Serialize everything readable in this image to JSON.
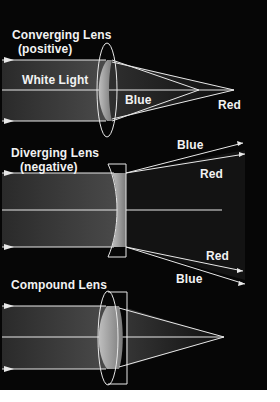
{
  "diagram": {
    "colors": {
      "background": "#060606",
      "line": "#e8e8e8",
      "text": "#f2f2f2",
      "page": "#ffffff"
    },
    "panels": [
      {
        "id": "converging",
        "title": "Converging Lens",
        "subtitle": "(positive)",
        "beam_label": "White Light",
        "labels": {
          "blue": "Blue",
          "red": "Red"
        }
      },
      {
        "id": "diverging",
        "title": "Diverging Lens",
        "subtitle": "(negative)",
        "labels": {
          "blue_top": "Blue",
          "red_top": "Red",
          "red_bottom": "Red",
          "blue_bottom": "Blue"
        }
      },
      {
        "id": "compound",
        "title": "Compound Lens"
      }
    ]
  }
}
